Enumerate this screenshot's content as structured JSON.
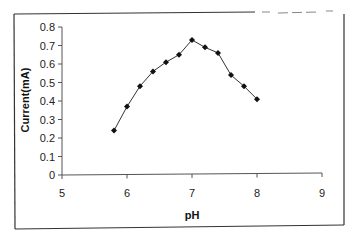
{
  "chart_data": {
    "type": "line",
    "title": "",
    "xlabel": "pH",
    "ylabel": "Current(mA)",
    "xlim": [
      5,
      9
    ],
    "ylim": [
      0,
      0.8
    ],
    "x_ticks": [
      5,
      6,
      7,
      8,
      9
    ],
    "y_ticks": [
      0,
      0.1,
      0.2,
      0.3,
      0.4,
      0.5,
      0.6,
      0.7,
      0.8
    ],
    "grid": false,
    "legend": null,
    "series": [
      {
        "name": "Current",
        "marker": "diamond",
        "color": "#111111",
        "x": [
          5.8,
          6.0,
          6.2,
          6.4,
          6.6,
          6.8,
          7.0,
          7.2,
          7.4,
          7.6,
          7.8,
          8.0
        ],
        "values": [
          0.24,
          0.37,
          0.48,
          0.56,
          0.61,
          0.65,
          0.73,
          0.69,
          0.66,
          0.54,
          0.48,
          0.41
        ]
      }
    ]
  },
  "labels": {
    "x_axis_title": "pH",
    "y_axis_title": "Current(mA)"
  }
}
